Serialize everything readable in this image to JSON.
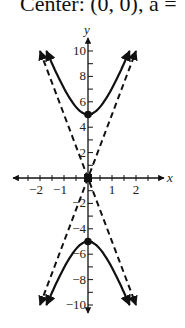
{
  "caption": "Center: (0, 0), a =",
  "chart_data": {
    "type": "line",
    "title": "Center: (0, 0), a =",
    "xlabel": "x",
    "ylabel": "y",
    "xlim": [
      -2.5,
      2.5
    ],
    "ylim": [
      -10.5,
      10.5
    ],
    "x_ticks": [
      -2,
      -1,
      1,
      2
    ],
    "y_ticks": [
      -10,
      -8,
      -6,
      -4,
      -2,
      2,
      4,
      6,
      8,
      10
    ],
    "grid": false,
    "series": [
      {
        "name": "hyperbola upper branch",
        "style": "solid",
        "equation": "y^2/25 - x^2 = 1",
        "vertex": [
          0,
          5
        ]
      },
      {
        "name": "hyperbola lower branch",
        "style": "solid",
        "equation": "y^2/25 - x^2 = 1",
        "vertex": [
          0,
          -5
        ]
      },
      {
        "name": "asymptote y=5x",
        "style": "dashed",
        "points": [
          [
            -2,
            -10
          ],
          [
            2,
            10
          ]
        ]
      },
      {
        "name": "asymptote y=-5x",
        "style": "dashed",
        "points": [
          [
            -2,
            10
          ],
          [
            2,
            -10
          ]
        ]
      }
    ],
    "points": [
      {
        "label": "vertex",
        "x": 0,
        "y": 5
      },
      {
        "label": "vertex",
        "x": 0,
        "y": -5
      },
      {
        "label": "center",
        "x": 0,
        "y": 0
      }
    ]
  }
}
